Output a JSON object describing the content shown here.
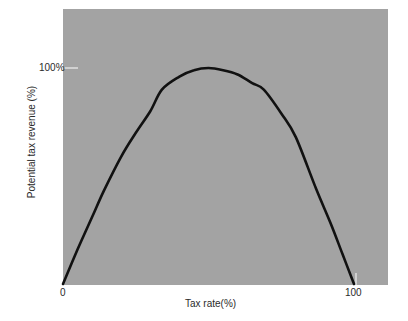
{
  "chart_data": {
    "type": "line",
    "title": "",
    "xlabel": "Tax rate(%)",
    "ylabel": "Potential tax revenue (%)",
    "xlim": [
      0,
      100
    ],
    "ylim": [
      0,
      100
    ],
    "x_ticks": [
      {
        "value": 0,
        "label": "0"
      },
      {
        "value": 100,
        "label": "100"
      }
    ],
    "y_ticks": [
      {
        "value": 100,
        "label": "100%"
      }
    ],
    "grid": false,
    "legend": null,
    "series": [
      {
        "name": "Laffer curve",
        "color": "#111111",
        "x": [
          0,
          5,
          10,
          14,
          20,
          25,
          30,
          34,
          40,
          45,
          50,
          55,
          60,
          65,
          69,
          75,
          80,
          87,
          92,
          96,
          100
        ],
        "y": [
          0,
          16,
          31,
          43,
          59,
          70,
          80,
          90,
          96,
          99,
          100,
          99,
          97,
          93,
          90,
          79,
          68,
          44,
          28,
          14,
          0
        ]
      }
    ]
  },
  "style": {
    "plot_background": "#a3a3a3",
    "page_background": "#ffffff",
    "tick_color": "#f0f0f0"
  }
}
